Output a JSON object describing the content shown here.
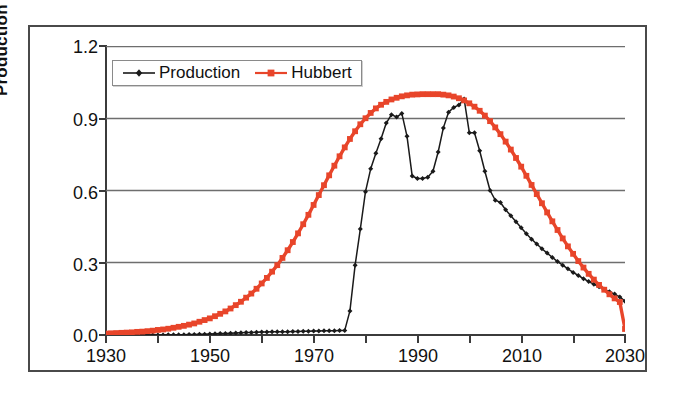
{
  "chart_data": {
    "type": "line",
    "title": "",
    "xlabel": "",
    "ylabel": "Production Gb/a",
    "xlim": [
      1930,
      2030
    ],
    "ylim": [
      0.0,
      1.2
    ],
    "ytick_labels": [
      "1.2",
      "0.9",
      "0.6",
      "0.3",
      "0.0"
    ],
    "ytick_values": [
      1.2,
      0.9,
      0.6,
      0.3,
      0.0
    ],
    "xtick_labels": [
      "1930",
      "1950",
      "1970",
      "1990",
      "2010",
      "2030"
    ],
    "xtick_values": [
      1930,
      1950,
      1970,
      1990,
      2010,
      2030
    ],
    "xminor_ticks": [
      1940,
      1960,
      1980,
      2000,
      2020
    ],
    "grid": "horizontal",
    "legend_position": "upper-left-inside",
    "colors": {
      "production": "#1a1a1a",
      "hubbert": "#E8452A",
      "axis": "#3b3b3b",
      "grid": "#6e6e6e",
      "frame": "#4a4a4a",
      "background": "#ffffff"
    },
    "series": [
      {
        "name": "Production",
        "color": "#1a1a1a",
        "marker": "diamond",
        "x": [
          1930,
          1931,
          1932,
          1933,
          1934,
          1935,
          1936,
          1937,
          1938,
          1939,
          1940,
          1941,
          1942,
          1943,
          1944,
          1945,
          1946,
          1947,
          1948,
          1949,
          1950,
          1951,
          1952,
          1953,
          1954,
          1955,
          1956,
          1957,
          1958,
          1959,
          1960,
          1961,
          1962,
          1963,
          1964,
          1965,
          1966,
          1967,
          1968,
          1969,
          1970,
          1971,
          1972,
          1973,
          1974,
          1975,
          1976,
          1977,
          1978,
          1979,
          1980,
          1981,
          1982,
          1983,
          1984,
          1985,
          1986,
          1987,
          1988,
          1989,
          1990,
          1991,
          1992,
          1993,
          1994,
          1995,
          1996,
          1997,
          1998,
          1999,
          2000,
          2001,
          2002,
          2003,
          2004,
          2005,
          2006,
          2007,
          2008,
          2009,
          2010,
          2011,
          2012,
          2013,
          2014,
          2015,
          2016,
          2017,
          2018,
          2019,
          2020,
          2021,
          2022,
          2023,
          2024,
          2025,
          2026,
          2027,
          2028,
          2029,
          2030
        ],
        "y": [
          0.0,
          0.0,
          0.0,
          0.0,
          0.0,
          0.0,
          0.0,
          0.0,
          0.0,
          0.0,
          0.0,
          0.0,
          0.001,
          0.001,
          0.001,
          0.001,
          0.002,
          0.002,
          0.003,
          0.003,
          0.004,
          0.005,
          0.006,
          0.006,
          0.007,
          0.008,
          0.009,
          0.01,
          0.01,
          0.011,
          0.012,
          0.012,
          0.013,
          0.013,
          0.014,
          0.014,
          0.015,
          0.015,
          0.016,
          0.016,
          0.017,
          0.017,
          0.018,
          0.018,
          0.018,
          0.019,
          0.019,
          0.1,
          0.29,
          0.44,
          0.595,
          0.69,
          0.755,
          0.815,
          0.88,
          0.915,
          0.905,
          0.92,
          0.825,
          0.66,
          0.65,
          0.65,
          0.655,
          0.68,
          0.76,
          0.86,
          0.925,
          0.945,
          0.955,
          0.98,
          0.84,
          0.84,
          0.765,
          0.68,
          0.6,
          0.56,
          0.55,
          0.52,
          0.495,
          0.47,
          0.445,
          0.42,
          0.398,
          0.378,
          0.358,
          0.34,
          0.322,
          0.305,
          0.29,
          0.275,
          0.26,
          0.247,
          0.234,
          0.222,
          0.211,
          0.2,
          0.19,
          0.18,
          0.17,
          0.158,
          0.14
        ]
      },
      {
        "name": "Hubbert",
        "color": "#E8452A",
        "marker": "square",
        "x": [
          1930,
          1931,
          1932,
          1933,
          1934,
          1935,
          1936,
          1937,
          1938,
          1939,
          1940,
          1941,
          1942,
          1943,
          1944,
          1945,
          1946,
          1947,
          1948,
          1949,
          1950,
          1951,
          1952,
          1953,
          1954,
          1955,
          1956,
          1957,
          1958,
          1959,
          1960,
          1961,
          1962,
          1963,
          1964,
          1965,
          1966,
          1967,
          1968,
          1969,
          1970,
          1971,
          1972,
          1973,
          1974,
          1975,
          1976,
          1977,
          1978,
          1979,
          1980,
          1981,
          1982,
          1983,
          1984,
          1985,
          1986,
          1987,
          1988,
          1989,
          1990,
          1991,
          1992,
          1993,
          1994,
          1995,
          1996,
          1997,
          1998,
          1999,
          2000,
          2001,
          2002,
          2003,
          2004,
          2005,
          2006,
          2007,
          2008,
          2009,
          2010,
          2011,
          2012,
          2013,
          2014,
          2015,
          2016,
          2017,
          2018,
          2019,
          2020,
          2021,
          2022,
          2023,
          2024,
          2025,
          2026,
          2027,
          2028,
          2029,
          2030
        ],
        "y": [
          0.006,
          0.007,
          0.008,
          0.009,
          0.01,
          0.011,
          0.013,
          0.014,
          0.016,
          0.018,
          0.021,
          0.023,
          0.026,
          0.03,
          0.034,
          0.038,
          0.043,
          0.048,
          0.055,
          0.062,
          0.069,
          0.078,
          0.088,
          0.098,
          0.11,
          0.124,
          0.138,
          0.155,
          0.172,
          0.192,
          0.214,
          0.237,
          0.263,
          0.29,
          0.32,
          0.352,
          0.386,
          0.422,
          0.46,
          0.499,
          0.54,
          0.581,
          0.622,
          0.663,
          0.703,
          0.742,
          0.779,
          0.814,
          0.846,
          0.875,
          0.9,
          0.922,
          0.941,
          0.956,
          0.968,
          0.978,
          0.985,
          0.991,
          0.995,
          0.998,
          0.999,
          1.0,
          1.0,
          1.0,
          1.0,
          0.998,
          0.995,
          0.99,
          0.983,
          0.974,
          0.962,
          0.948,
          0.931,
          0.911,
          0.888,
          0.862,
          0.834,
          0.803,
          0.77,
          0.735,
          0.699,
          0.661,
          0.623,
          0.585,
          0.547,
          0.509,
          0.472,
          0.436,
          0.401,
          0.368,
          0.337,
          0.307,
          0.28,
          0.254,
          0.23,
          0.208,
          0.188,
          0.169,
          0.152,
          0.137,
          0.025
        ]
      }
    ]
  },
  "legend": {
    "items": [
      {
        "label": "Production",
        "color": "#1a1a1a",
        "marker": "diamond"
      },
      {
        "label": "Hubbert",
        "color": "#E8452A",
        "marker": "square"
      }
    ]
  },
  "axes": {
    "ylabel": "Production Gb/a",
    "ytick_0": "1.2",
    "ytick_1": "0.9",
    "ytick_2": "0.6",
    "ytick_3": "0.3",
    "ytick_4": "0.0",
    "xtick_0": "1930",
    "xtick_1": "1950",
    "xtick_2": "1970",
    "xtick_3": "1990",
    "xtick_4": "2010",
    "xtick_5": "2030"
  }
}
